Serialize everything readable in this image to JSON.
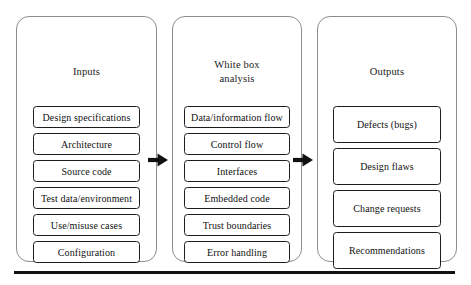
{
  "diagram": {
    "columns": [
      {
        "id": "inputs",
        "title": "Inputs",
        "items": [
          "Design specifications",
          "Architecture",
          "Source code",
          "Test data/environment",
          "Use/misuse cases",
          "Configuration"
        ]
      },
      {
        "id": "analysis",
        "title_line1": "White box",
        "title_line2": "analysis",
        "items": [
          "Data/information flow",
          "Control flow",
          "Interfaces",
          "Embedded code",
          "Trust boundaries",
          "Error handling"
        ]
      },
      {
        "id": "outputs",
        "title": "Outputs",
        "items": [
          "Defects (bugs)",
          "Design flaws",
          "Change requests",
          "Recommendations"
        ]
      }
    ],
    "arrows": [
      {
        "id": "arrow-inputs-to-analysis",
        "direction": "right"
      },
      {
        "id": "arrow-analysis-to-outputs",
        "direction": "right"
      }
    ],
    "colors": {
      "panel_border": "#8d8d8d",
      "item_border": "#1c1c1c",
      "arrow": "#111111",
      "rule": "#111111",
      "background": "#ffffff",
      "text": "#111111"
    }
  }
}
